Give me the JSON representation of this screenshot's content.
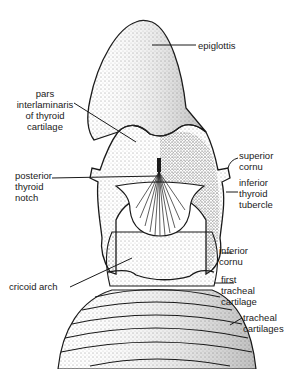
{
  "figure": {
    "labels": {
      "epiglottis": "epiglottis",
      "pars_interlaminaris": "pars\ninterlaminaris\nof thyroid\ncartilage",
      "superior_cornu": "superior\ncornu",
      "posterior_thyroid_notch": "posterior\nthyroid\nnotch",
      "inferior_thyroid_tubercle": "inferior\nthyroid\ntubercle",
      "inferior_cornu": "inferior\ncornu",
      "cricoid_arch": "cricoid arch",
      "first_tracheal_cartilage": "first\ntracheal\ncartilage",
      "tracheal_cartilages": "tracheal\ncartilages"
    },
    "colors": {
      "ink": "#1a1a1a",
      "background": "#ffffff"
    }
  }
}
